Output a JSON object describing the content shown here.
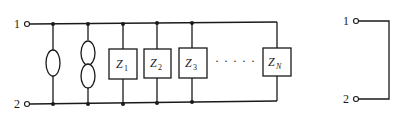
{
  "diagram": {
    "left_circuit": {
      "terminals": [
        {
          "label": "1"
        },
        {
          "label": "2"
        }
      ],
      "elements": [
        {
          "type": "ellipse",
          "name": "single-loop"
        },
        {
          "type": "double-ellipse",
          "name": "double-loop"
        },
        {
          "type": "impedance",
          "symbol": "Z",
          "sub": "1"
        },
        {
          "type": "impedance",
          "symbol": "Z",
          "sub": "2"
        },
        {
          "type": "impedance",
          "symbol": "Z",
          "sub": "3"
        },
        {
          "type": "impedance",
          "symbol": "Z",
          "sub": "N"
        }
      ],
      "ellipsis": "· · · · ·"
    },
    "right_circuit": {
      "terminals": [
        {
          "label": "1"
        },
        {
          "label": "2"
        }
      ],
      "description": "short circuit between terminals"
    }
  }
}
